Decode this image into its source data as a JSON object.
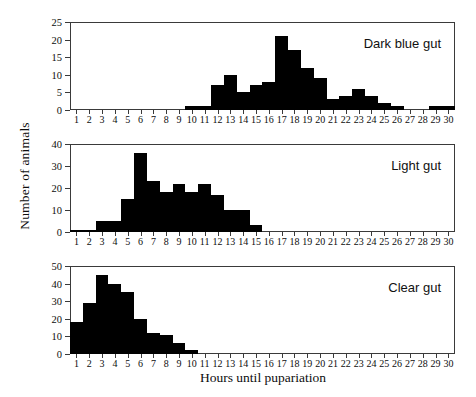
{
  "figure": {
    "xlabel": "Hours until pupariation",
    "ylabel": "Number of animals",
    "bar_color": "#000000",
    "axis_color": "#3a3a3a"
  },
  "chart_data": [
    {
      "type": "bar",
      "title": "Dark blue gut",
      "xlabel": "Hours until pupariation",
      "ylabel": "Number of animals",
      "xlim": [
        0,
        30
      ],
      "ylim": [
        0,
        25
      ],
      "yticks": [
        0,
        5,
        10,
        15,
        20,
        25
      ],
      "grid": false,
      "legend": false,
      "categories": [
        1,
        2,
        3,
        4,
        5,
        6,
        7,
        8,
        9,
        10,
        11,
        12,
        13,
        14,
        15,
        16,
        17,
        18,
        19,
        20,
        21,
        22,
        23,
        24,
        25,
        26,
        27,
        28,
        29,
        30
      ],
      "values": [
        0,
        0,
        0,
        0,
        0,
        0,
        0,
        0,
        0,
        1,
        1,
        7,
        10,
        5,
        7,
        8,
        21,
        17,
        12,
        9,
        3,
        4,
        6,
        4,
        2,
        1,
        0,
        0,
        1,
        1
      ]
    },
    {
      "type": "bar",
      "title": "Light gut",
      "xlabel": "Hours until pupariation",
      "ylabel": "Number of animals",
      "xlim": [
        0,
        30
      ],
      "ylim": [
        0,
        40
      ],
      "yticks": [
        0,
        10,
        20,
        30,
        40
      ],
      "grid": false,
      "legend": false,
      "categories": [
        1,
        2,
        3,
        4,
        5,
        6,
        7,
        8,
        9,
        10,
        11,
        12,
        13,
        14,
        15,
        16,
        17,
        18,
        19,
        20,
        21,
        22,
        23,
        24,
        25,
        26,
        27,
        28,
        29,
        30
      ],
      "values": [
        1,
        1,
        5,
        5,
        15,
        36,
        23,
        18,
        22,
        18,
        22,
        17,
        10,
        10,
        3,
        0,
        0,
        0,
        0,
        0,
        0,
        0,
        0,
        0,
        0,
        0,
        0,
        0,
        0,
        0
      ]
    },
    {
      "type": "bar",
      "title": "Clear gut",
      "xlabel": "Hours until pupariation",
      "ylabel": "Number of animals",
      "xlim": [
        0,
        30
      ],
      "ylim": [
        0,
        50
      ],
      "yticks": [
        0,
        10,
        20,
        30,
        40,
        50
      ],
      "grid": false,
      "legend": false,
      "categories": [
        1,
        2,
        3,
        4,
        5,
        6,
        7,
        8,
        9,
        10,
        11,
        12,
        13,
        14,
        15,
        16,
        17,
        18,
        19,
        20,
        21,
        22,
        23,
        24,
        25,
        26,
        27,
        28,
        29,
        30
      ],
      "values": [
        18,
        29,
        45,
        40,
        35,
        20,
        12,
        11,
        6,
        2.5,
        0,
        0,
        0,
        0,
        0,
        0,
        0,
        0,
        0,
        0,
        0,
        0,
        0,
        0,
        0,
        0,
        0,
        0,
        0,
        0
      ]
    }
  ]
}
